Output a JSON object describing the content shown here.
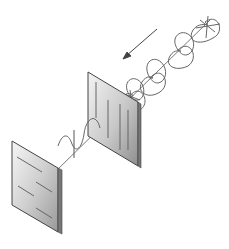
{
  "diagram": {
    "type": "light-polarization",
    "elements": [
      {
        "id": "unpolarized-wave",
        "description": "unpolarized light wave with multiple oscillation planes travelling along the beam axis"
      },
      {
        "id": "direction-arrow",
        "description": "arrow showing propagation direction toward the polarizers"
      },
      {
        "id": "polarizer-1",
        "description": "first polarizing filter with vertical slit lines"
      },
      {
        "id": "polarized-wave",
        "description": "linearly polarized light wave after the first filter"
      },
      {
        "id": "polarizer-2",
        "description": "second polarizing filter with horizontal slit lines (crossed)"
      }
    ],
    "colors": {
      "background": "#ffffff",
      "stroke": "#555555",
      "wave": "#6a6a6a",
      "panel_light": "#f2f2f2",
      "panel_dark": "#9a9a9a"
    }
  }
}
